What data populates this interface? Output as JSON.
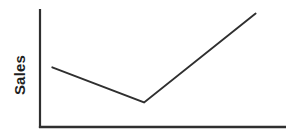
{
  "chart_data": {
    "type": "line",
    "title": "",
    "xlabel": "",
    "ylabel": "Sales",
    "x_fractions": [
      0.05,
      0.425,
      0.88
    ],
    "values": [
      51,
      21,
      97
    ],
    "ylim": [
      0,
      100
    ],
    "grid": "off",
    "legend": "none",
    "axis_ticks": "none",
    "axis_color": "#2f2f2f",
    "line_color": "#2f2f2f",
    "background_color": "#ffffff",
    "text_color": "#1f1f1f"
  }
}
